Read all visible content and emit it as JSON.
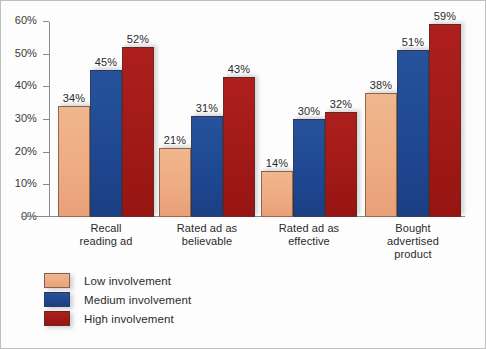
{
  "chart_data": {
    "type": "bar",
    "title": "",
    "subtitle": "",
    "xlabel": "",
    "ylabel": "",
    "ylim": [
      0,
      60
    ],
    "y_tick_labels": [
      "60%",
      "50%",
      "40%",
      "30%",
      "20%",
      "10%",
      "0%"
    ],
    "y_tick_values": [
      60,
      50,
      40,
      30,
      20,
      10,
      0
    ],
    "grid": false,
    "legend_position": "bottom-left",
    "value_suffix": "%",
    "categories": [
      "Recall\nreading ad",
      "Rated ad as\nbelievable",
      "Rated ad as\neffective",
      "Bought\nadvertised\nproduct"
    ],
    "category_lines": [
      [
        "Recall",
        "reading ad"
      ],
      [
        "Rated ad as",
        "believable"
      ],
      [
        "Rated ad as",
        "effective"
      ],
      [
        "Bought",
        "advertised",
        "product"
      ]
    ],
    "series": [
      {
        "name": "Low involvement",
        "key": "low",
        "color": "#eeac82",
        "values": [
          34,
          21,
          14,
          38
        ],
        "labels": [
          "34%",
          "21%",
          "14%",
          "38%"
        ]
      },
      {
        "name": "Medium involvement",
        "key": "medium",
        "color": "#1f4892",
        "values": [
          45,
          31,
          30,
          51
        ],
        "labels": [
          "45%",
          "31%",
          "30%",
          "51%"
        ]
      },
      {
        "name": "High involvement",
        "key": "high",
        "color": "#a21a17",
        "values": [
          52,
          43,
          32,
          59
        ],
        "labels": [
          "52%",
          "43%",
          "32%",
          "59%"
        ]
      }
    ]
  },
  "legend": {
    "items": [
      {
        "label": "Low involvement",
        "key": "low"
      },
      {
        "label": "Medium involvement",
        "key": "medium"
      },
      {
        "label": "High involvement",
        "key": "high"
      }
    ]
  }
}
